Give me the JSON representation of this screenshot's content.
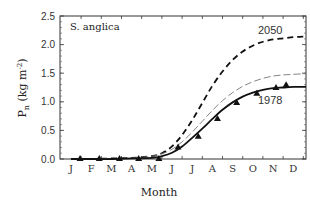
{
  "chart_data": {
    "type": "line",
    "title": "S. anglica",
    "xlabel": "Month",
    "ylabel": "P_n (kg m^-2)",
    "ylabel_parts": {
      "main": "P",
      "sub": "n",
      "unit_open": " (kg m",
      "sup": "-2",
      "unit_close": ")"
    },
    "ylim": [
      0,
      2.5
    ],
    "yticks": [
      "0.0",
      "0.5",
      "1.0",
      "1.5",
      "2.0",
      "2.5"
    ],
    "categories": [
      "J",
      "F",
      "M",
      "A",
      "M",
      "J",
      "J",
      "A",
      "S",
      "O",
      "N",
      "D"
    ],
    "grid": false,
    "legend": "none (inline annotations)",
    "annotations": [
      {
        "text": "2050",
        "near_series": "2050 projection"
      },
      {
        "text": "1978",
        "near_series": "1978 model"
      }
    ],
    "series": [
      {
        "name": "2050 projection",
        "style": "heavy dashed",
        "x": [
          0,
          1,
          2,
          3,
          4,
          4.5,
          5,
          5.5,
          6,
          6.5,
          7,
          7.5,
          8,
          8.5,
          9,
          9.5,
          10,
          10.5,
          11,
          11.5
        ],
        "values": [
          0.0,
          0.0,
          0.01,
          0.02,
          0.05,
          0.1,
          0.22,
          0.42,
          0.68,
          0.98,
          1.28,
          1.53,
          1.73,
          1.88,
          1.98,
          2.05,
          2.09,
          2.11,
          2.13,
          2.14
        ]
      },
      {
        "name": "intermediate projection",
        "style": "light dashed",
        "x": [
          0,
          1,
          2,
          3,
          4,
          4.5,
          5,
          5.5,
          6,
          6.5,
          7,
          7.5,
          8,
          8.5,
          9,
          9.5,
          10,
          10.5,
          11,
          11.5
        ],
        "values": [
          0.0,
          0.0,
          0.01,
          0.02,
          0.05,
          0.09,
          0.17,
          0.3,
          0.47,
          0.66,
          0.85,
          1.02,
          1.16,
          1.27,
          1.35,
          1.41,
          1.45,
          1.47,
          1.48,
          1.49
        ]
      },
      {
        "name": "1978 model",
        "style": "solid",
        "x": [
          0,
          1,
          2,
          3,
          4,
          4.5,
          5,
          5.5,
          6,
          6.5,
          7,
          7.5,
          8,
          8.5,
          9,
          9.5,
          10,
          10.5,
          11,
          11.5
        ],
        "values": [
          0.0,
          0.0,
          0.0,
          0.01,
          0.02,
          0.05,
          0.11,
          0.22,
          0.37,
          0.53,
          0.7,
          0.86,
          0.99,
          1.09,
          1.16,
          1.21,
          1.24,
          1.25,
          1.26,
          1.26
        ]
      },
      {
        "name": "1978 observed",
        "style": "triangle markers",
        "x": [
          0.45,
          1.4,
          2.4,
          3.35,
          4.35,
          5.3,
          6.3,
          7.25,
          8.2,
          9.2,
          10.15,
          10.65
        ],
        "values": [
          0.0,
          0.0,
          0.0,
          0.0,
          0.0,
          0.2,
          0.39,
          0.7,
          0.98,
          1.14,
          1.24,
          1.29
        ]
      }
    ]
  }
}
